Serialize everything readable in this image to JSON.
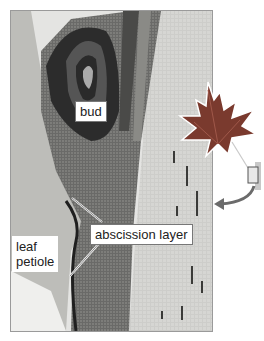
{
  "figure": {
    "labels": {
      "bud": "bud",
      "abscission_layer": "abscission layer",
      "leaf_petiole": "leaf\npetiole"
    },
    "inset": {
      "description": "maple leaf with highlighted box at petiole base",
      "icon": "maple-leaf-icon",
      "arrow": "curved-arrow-icon"
    },
    "colors": {
      "leaf": "#7a3a2e",
      "leaf_light": "#a0584a",
      "arrow": "#6b6b6b",
      "stem_light": "#cfcfcb",
      "bud_dark": "#2a2a2a"
    }
  }
}
